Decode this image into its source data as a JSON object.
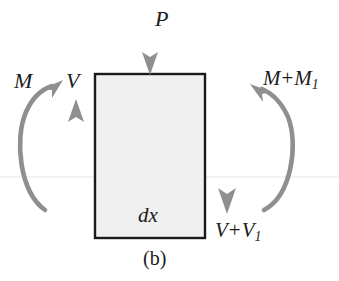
{
  "figure": {
    "caption": "(b)"
  },
  "block": {
    "interior_label": "dx",
    "fill_color": "#f0f0f0",
    "stroke_color": "#1a1a1a",
    "x": 95,
    "y": 74,
    "width": 110,
    "height": 164
  },
  "arrow_color": "#8f8f8f",
  "labels": {
    "load_top": "P",
    "moment_left": "M",
    "shear_left": "V",
    "moment_right_base": "M",
    "moment_right_op": "+",
    "moment_right_term": "M",
    "moment_right_sub": "1",
    "shear_right_base": "V",
    "shear_right_op": "+",
    "shear_right_term": "V",
    "shear_right_sub": "1"
  },
  "forces": [
    {
      "name": "axial-load-P",
      "label": "P",
      "type": "straight-arrow",
      "direction": "down",
      "x": 150,
      "y_start": 10,
      "y_end": 74
    },
    {
      "name": "shear-left-V",
      "label": "V",
      "type": "straight-arrow",
      "direction": "up",
      "x": 76,
      "y_start": 215,
      "y_end": 100
    },
    {
      "name": "shear-right-V-plus-V1",
      "label": "V + V1",
      "type": "straight-arrow",
      "direction": "down",
      "x": 227,
      "y_start": 105,
      "y_end": 212
    },
    {
      "name": "moment-left-M",
      "label": "M",
      "type": "curved-arrow",
      "rotation": "counterclockwise",
      "opens": "right"
    },
    {
      "name": "moment-right-M-plus-M1",
      "label": "M + M1",
      "type": "curved-arrow",
      "rotation": "clockwise",
      "opens": "left"
    }
  ],
  "artifacts": {
    "scan_line_y": 177,
    "scan_line_color": "#ededed"
  }
}
